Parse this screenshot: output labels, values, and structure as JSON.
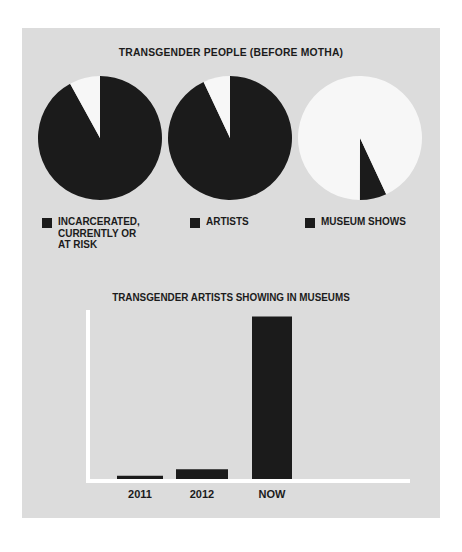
{
  "poster": {
    "background_color": "#dcdcdc",
    "ink_color": "#1b1b1b",
    "axis_color": "#ffffff"
  },
  "pies_title": "TRANSGENDER PEOPLE (BEFORE MOTHA)",
  "legend": [
    {
      "label": "INCARCERATED,\nCURRENTLY OR\nAT RISK",
      "swatch_color": "#1b1b1b"
    },
    {
      "label": "ARTISTS",
      "swatch_color": "#1b1b1b"
    },
    {
      "label": "MUSEUM SHOWS",
      "swatch_color": "#1b1b1b"
    }
  ],
  "bar_title": "TRANSGENDER ARTISTS SHOWING IN MUSEUMS",
  "chart_data": [
    {
      "type": "pie",
      "title": "INCARCERATED, CURRENTLY OR AT RISK",
      "labels": [
        "INCARCERATED, CURRENTLY OR AT RISK",
        "REMAINDER"
      ],
      "values": [
        92,
        8
      ],
      "colors": [
        "#1b1b1b",
        "#f7f7f7"
      ],
      "start_angle_deg": 0,
      "direction": "clockwise",
      "legend": "below",
      "grid": false
    },
    {
      "type": "pie",
      "title": "ARTISTS",
      "labels": [
        "ARTISTS",
        "REMAINDER"
      ],
      "values": [
        93,
        7
      ],
      "colors": [
        "#1b1b1b",
        "#f7f7f7"
      ],
      "start_angle_deg": 0,
      "direction": "clockwise",
      "legend": "below",
      "grid": false
    },
    {
      "type": "pie",
      "title": "MUSEUM SHOWS",
      "labels": [
        "MUSEUM SHOWS",
        "REMAINDER"
      ],
      "values": [
        7,
        93
      ],
      "colors": [
        "#1b1b1b",
        "#f7f7f7"
      ],
      "start_angle_deg": 155,
      "direction": "clockwise",
      "legend": "below",
      "grid": false
    },
    {
      "type": "bar",
      "title": "TRANSGENDER ARTISTS SHOWING IN MUSEUMS",
      "categories": [
        "2011",
        "2012",
        "NOW"
      ],
      "values": [
        2,
        6,
        100
      ],
      "xlabel": "",
      "ylabel": "",
      "ylim": [
        0,
        104
      ],
      "bar_color": "#1b1b1b",
      "axis_color": "#ffffff",
      "grid": false,
      "legend": "none"
    }
  ]
}
